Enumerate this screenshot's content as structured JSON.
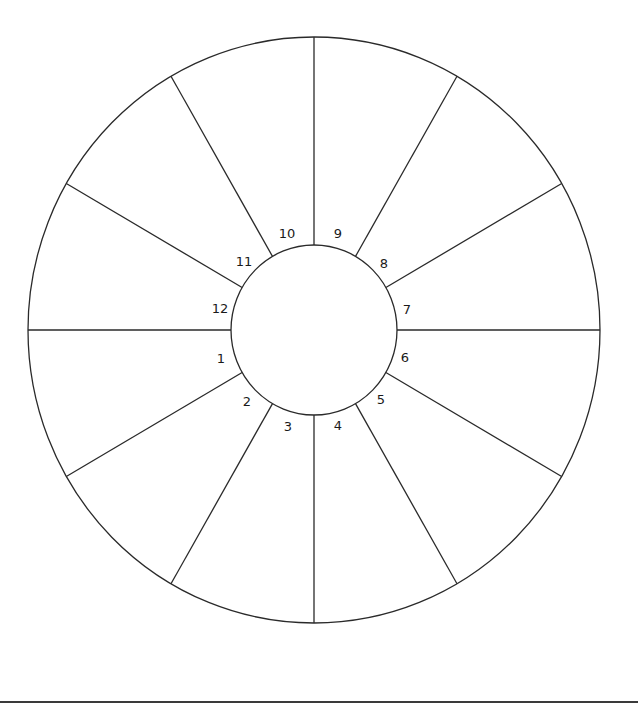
{
  "diagram": {
    "type": "astrology-house-wheel",
    "title": "",
    "outer_circle": {
      "cx": 314,
      "cy": 330,
      "rx": 286,
      "ry": 293
    },
    "inner_circle": {
      "cx": 314,
      "cy": 330,
      "rx": 83,
      "ry": 85
    },
    "divisions": 12,
    "stroke_color": "#2a2a2a",
    "background_color": "#ffffff",
    "houses": [
      {
        "number": "1",
        "x": 221,
        "y": 358
      },
      {
        "number": "2",
        "x": 247,
        "y": 401
      },
      {
        "number": "3",
        "x": 288,
        "y": 426
      },
      {
        "number": "4",
        "x": 338,
        "y": 425
      },
      {
        "number": "5",
        "x": 381,
        "y": 399
      },
      {
        "number": "6",
        "x": 405,
        "y": 357
      },
      {
        "number": "7",
        "x": 407,
        "y": 309
      },
      {
        "number": "8",
        "x": 384,
        "y": 263
      },
      {
        "number": "9",
        "x": 338,
        "y": 233
      },
      {
        "number": "10",
        "x": 287,
        "y": 233
      },
      {
        "number": "11",
        "x": 244,
        "y": 261
      },
      {
        "number": "12",
        "x": 220,
        "y": 308
      }
    ],
    "bottom_rule_color": "#3a3a3a"
  }
}
